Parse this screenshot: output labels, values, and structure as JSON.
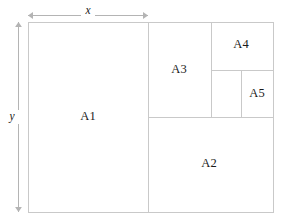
{
  "diagram": {
    "type": "rectangle-partition",
    "background_color": "#ffffff",
    "line_color": "#c9c9c9",
    "dimension_color": "#b4b4b4",
    "label_color": "#1a1a1a",
    "outer": {
      "x": 28,
      "y": 22,
      "width": 245,
      "height": 190
    },
    "dimensions": [
      {
        "name": "width-dimension",
        "label": "x",
        "orientation": "horizontal",
        "from": 28,
        "to": 148,
        "at": 15,
        "label_x": 88,
        "label_y": 11
      },
      {
        "name": "height-dimension",
        "label": "y",
        "orientation": "vertical",
        "from": 22,
        "to": 212,
        "at": 18,
        "label_x": 12,
        "label_y": 117
      }
    ],
    "regions": [
      {
        "id": "A1",
        "label": "A1",
        "x": 28,
        "y": 22,
        "width": 120,
        "height": 190,
        "label_x": 88,
        "label_y": 117
      },
      {
        "id": "A2",
        "label": "A2",
        "x": 148,
        "y": 117,
        "width": 125,
        "height": 95,
        "label_x": 209,
        "label_y": 164
      },
      {
        "id": "A3",
        "label": "A3",
        "x": 148,
        "y": 22,
        "width": 63,
        "height": 95,
        "label_x": 179,
        "label_y": 70
      },
      {
        "id": "A4",
        "label": "A4",
        "x": 211,
        "y": 22,
        "width": 62,
        "height": 48,
        "label_x": 241,
        "label_y": 45
      },
      {
        "id": "unlabeled",
        "label": "",
        "x": 211,
        "y": 70,
        "width": 30,
        "height": 47,
        "label_x": 226,
        "label_y": 94
      },
      {
        "id": "A5",
        "label": "A5",
        "x": 241,
        "y": 70,
        "width": 32,
        "height": 47,
        "label_x": 257,
        "label_y": 94
      }
    ],
    "partition_lines": [
      {
        "name": "divider-a1-right",
        "x1": 148,
        "y1": 22,
        "x2": 148,
        "y2": 212
      },
      {
        "name": "divider-a2-top",
        "x1": 148,
        "y1": 117,
        "x2": 273,
        "y2": 117
      },
      {
        "name": "divider-a3-right",
        "x1": 211,
        "y1": 22,
        "x2": 211,
        "y2": 117
      },
      {
        "name": "divider-a4-bottom",
        "x1": 211,
        "y1": 70,
        "x2": 273,
        "y2": 70
      },
      {
        "name": "divider-a5-left",
        "x1": 241,
        "y1": 70,
        "x2": 241,
        "y2": 117
      }
    ]
  }
}
